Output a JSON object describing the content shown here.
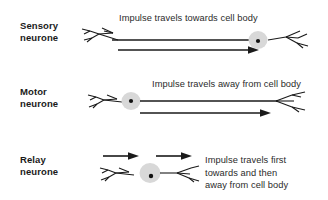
{
  "diagram": {
    "background_color": "#ffffff",
    "ink_color": "#1a1a1a",
    "cell_body_fill": "#d8d8d8",
    "nucleus_color": "#111111"
  },
  "rows": [
    {
      "id": "sensory",
      "label": "Sensory\nneurone",
      "caption": "Impulse travels towards cell body",
      "impulse_direction": "left-to-right",
      "cell_body_position": "right"
    },
    {
      "id": "motor",
      "label": "Motor\nneurone",
      "caption": "Impulse travels away from cell body",
      "impulse_direction": "left-to-right",
      "cell_body_position": "left"
    },
    {
      "id": "relay",
      "label": "Relay\nneurone",
      "caption": "Impulse travels first\ntowards and then\naway from cell body",
      "impulse_direction": "left-to-right",
      "cell_body_position": "centre"
    }
  ]
}
